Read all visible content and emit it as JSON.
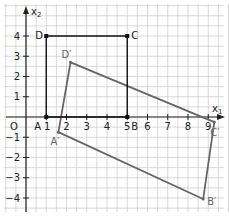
{
  "diagram": {
    "type": "coordinate-geometry",
    "axes": {
      "x_label": "x",
      "x_label_sub": "1",
      "y_label": "x",
      "y_label_sub": "2",
      "origin_label": "O",
      "x_ticks": [
        "1",
        "2",
        "3",
        "4",
        "5",
        "6",
        "7",
        "8",
        "9"
      ],
      "y_ticks": [
        "4",
        "3",
        "2",
        "1",
        "−1",
        "−2",
        "−3",
        "−4"
      ],
      "xlim": [
        -1.3,
        9.9
      ],
      "ylim": [
        -4.7,
        5.7
      ]
    },
    "original_rectangle": {
      "color": "#111111",
      "points": [
        {
          "label": "A",
          "x": 1,
          "y": 0
        },
        {
          "label": "B",
          "x": 5,
          "y": 0
        },
        {
          "label": "C",
          "x": 5,
          "y": 4
        },
        {
          "label": "D",
          "x": 1,
          "y": 4
        }
      ]
    },
    "image_rectangle": {
      "color": "#666666",
      "points": [
        {
          "label": "A′",
          "x": 1.6,
          "y": -0.75
        },
        {
          "label": "B′",
          "x": 8.75,
          "y": -4.05
        },
        {
          "label": "C′",
          "x": 9.3,
          "y": -0.25
        },
        {
          "label": "D′",
          "x": 2.2,
          "y": 2.7
        }
      ]
    },
    "grid_color": "#cfcfcf",
    "axis_color": "#222222"
  }
}
